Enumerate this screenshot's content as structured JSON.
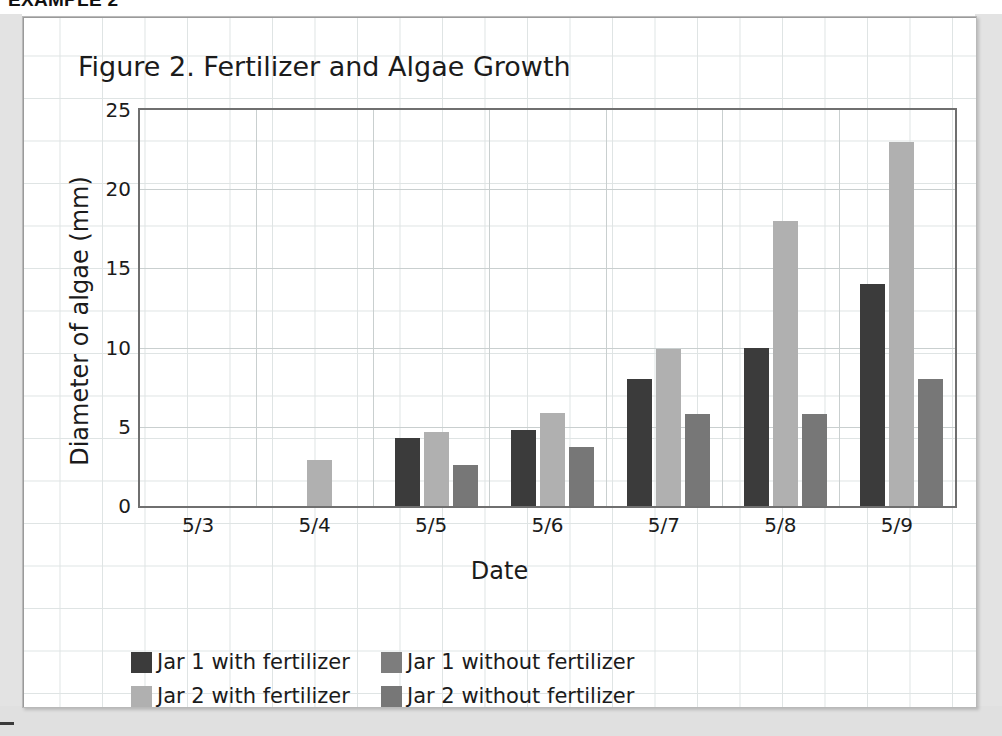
{
  "page": {
    "example_heading": "EXAMPLE 2"
  },
  "chart_data": {
    "type": "bar",
    "title": "Figure 2. Fertilizer and Algae Growth",
    "xlabel": "Date",
    "ylabel": "Diameter of algae (mm)",
    "categories": [
      "5/3",
      "5/4",
      "5/5",
      "5/6",
      "5/7",
      "5/8",
      "5/9"
    ],
    "ylim": [
      0,
      25
    ],
    "yticks": [
      0,
      5,
      10,
      15,
      20,
      25
    ],
    "grid": true,
    "legend_position": "bottom-left",
    "series": [
      {
        "name": "Jar 1 with fertilizer",
        "color": "#3b3b3b",
        "values": [
          0,
          0,
          4.3,
          4.8,
          8.0,
          10.0,
          14.0
        ]
      },
      {
        "name": "Jar 2 with fertilizer",
        "color": "#b0b0b0",
        "values": [
          0,
          2.9,
          4.7,
          5.9,
          9.9,
          18.0,
          23.0
        ]
      },
      {
        "name": "Jar 1 without fertilizer",
        "color": "#7d7d7d",
        "values": [
          0,
          0,
          0,
          0,
          0,
          0,
          0
        ]
      },
      {
        "name": "Jar 2 without fertilizer",
        "color": "#777777",
        "values": [
          0,
          0,
          2.6,
          3.7,
          5.8,
          5.8,
          8.0
        ]
      }
    ]
  },
  "legend": [
    {
      "label": "Jar 1 with fertilizer",
      "color": "#3b3b3b"
    },
    {
      "label": "Jar 1 without fertilizer",
      "color": "#7d7d7d"
    },
    {
      "label": "Jar 2 with fertilizer",
      "color": "#b0b0b0"
    },
    {
      "label": "Jar 2 without fertilizer",
      "color": "#777777"
    }
  ]
}
